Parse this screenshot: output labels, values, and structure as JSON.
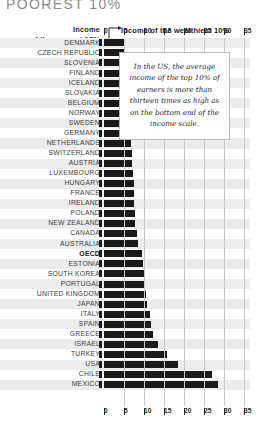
{
  "title": "POOREST 10%",
  "annotations": {
    "left_label_line1": "Income",
    "left_label_line2": "of the poorest 10%",
    "right_label": "Income of the wealthiest 10%",
    "left_arrow_icon": "arrow-left-icon",
    "right_arrow_icon": "arrow-right-icon"
  },
  "callout": {
    "text": "In the US, the average income of the top 10% of earners is more than thirteen times as high as on the bottom end of the income scale."
  },
  "chart_data": {
    "type": "bar",
    "orientation": "horizontal",
    "title": "POOREST 10%",
    "xlabel": "Income of the wealthiest 10%",
    "ylabel": "Income of the poorest 10%",
    "xlim": [
      0,
      35
    ],
    "ticks": [
      0,
      5,
      10,
      15,
      20,
      25,
      30,
      35
    ],
    "grid": true,
    "legend": "none",
    "bar_color": "#1a1a1a",
    "highlight": "OECD",
    "categories": [
      "DENMARK",
      "CZECH REPUBLIC",
      "SLOVENIA",
      "FINLAND",
      "ICELAND",
      "SLOVAKIA",
      "BELGIUM",
      "NORWAY",
      "SWEDEN",
      "GERMANY",
      "NETHERLANDS",
      "SWITZERLAND",
      "AUSTRIA",
      "LUXEMBOURG",
      "HUNGARY",
      "FRANCE",
      "IRELAND",
      "POLAND",
      "NEW ZEALAND",
      "CANADA",
      "AUSTRALIA",
      "OECD",
      "ESTONIA",
      "SOUTH KOREA",
      "PORTUGAL",
      "UNITED KINGDOM",
      "JAPAN",
      "ITALY",
      "SPAIN",
      "GREECE",
      "ISRAEL",
      "TURKEY",
      "USA",
      "CHILE",
      "MEXICO"
    ],
    "values": [
      5.2,
      5.3,
      5.3,
      5.4,
      5.5,
      5.6,
      5.9,
      6.1,
      6.3,
      6.6,
      6.8,
      6.9,
      7.0,
      7.3,
      7.4,
      7.4,
      7.6,
      7.7,
      7.8,
      8.2,
      8.5,
      9.6,
      9.7,
      10.1,
      10.2,
      10.5,
      10.7,
      11.4,
      11.7,
      12.3,
      13.6,
      15.7,
      18.5,
      27.0,
      28.5
    ]
  }
}
